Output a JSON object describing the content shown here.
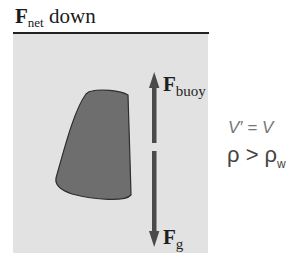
{
  "title": {
    "symbol": "F",
    "subscript": "net",
    "suffix": " down"
  },
  "diagram": {
    "panel_color": "#e2e2e2",
    "object_color": "#6e6e6e",
    "arrow_color": "#4a4a4a",
    "up_arrow": {
      "label": "F",
      "subscript": "buoy"
    },
    "down_arrow": {
      "label": "F",
      "subscript": "g"
    }
  },
  "equations": {
    "volume": "V′ = V",
    "density_lhs": "ρ > ρ",
    "density_sub": "w"
  }
}
